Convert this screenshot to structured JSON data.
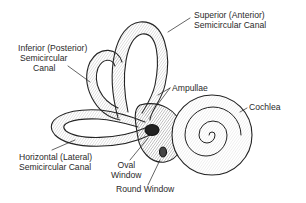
{
  "diagram": {
    "labels": {
      "superior": {
        "line1": "Superior (Anterior)",
        "line2": "Semicircular Canal"
      },
      "inferior": {
        "line1": "Inferior (Posterior)",
        "line2": "Semicircular",
        "line3": "Canal"
      },
      "ampullae": {
        "text": "Ampullae"
      },
      "cochlea": {
        "text": "Cochlea"
      },
      "horizontal": {
        "line1": "Horizontal (Lateral)",
        "line2": "Semicircular Canal"
      },
      "oval_window": {
        "line1": "Oval",
        "line2": "Window"
      },
      "round_window": {
        "text": "Round Window"
      }
    },
    "colors": {
      "ink": "#222222",
      "background": "#ffffff"
    }
  }
}
